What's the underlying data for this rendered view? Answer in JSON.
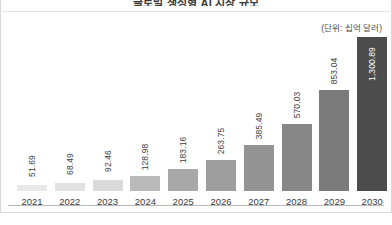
{
  "chart": {
    "title": "글로벌 생성형 AI 시장 규모",
    "unit_note": "(단위: 십억 달러)"
  },
  "chart_data": {
    "type": "bar",
    "title": "글로벌 생성형 AI 시장 규모",
    "subtitle": "(단위: 십억 달러)",
    "xlabel": "",
    "ylabel": "",
    "ylim": [
      0,
      1300.89
    ],
    "grid": false,
    "legend": false,
    "categories": [
      "2021",
      "2022",
      "2023",
      "2024",
      "2025",
      "2026",
      "2027",
      "2028",
      "2029",
      "2030"
    ],
    "values": [
      51.69,
      68.49,
      92.46,
      128.98,
      183.16,
      263.75,
      385.49,
      570.03,
      853.04,
      1300.89
    ],
    "value_labels": [
      "51.69",
      "68.49",
      "92.46",
      "128.98",
      "183.16",
      "263.75",
      "385.49",
      "570.03",
      "853.04",
      "1,300.89"
    ],
    "bar_colors": [
      "#e8e8e8",
      "#e1e1e1",
      "#dadada",
      "#b9b9b9",
      "#a8a8a8",
      "#9d9d9d",
      "#949494",
      "#878787",
      "#7a7a7a",
      "#4c4c4c"
    ],
    "label_placement": [
      "outside",
      "outside",
      "outside",
      "outside",
      "outside",
      "outside",
      "outside",
      "outside",
      "outside",
      "inside"
    ],
    "axis_color": "#b9b9b9"
  },
  "colors": {
    "highlight_bar": "#4c4c4c",
    "text": "#3a3a3a",
    "frame": "#d8d8d8"
  }
}
